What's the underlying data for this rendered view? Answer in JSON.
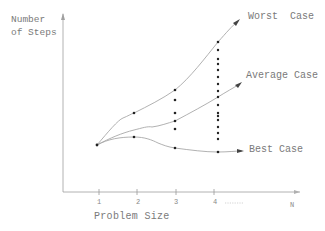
{
  "diagram": {
    "y_axis_label_line1": "Number",
    "y_axis_label_line2": "of Steps",
    "x_axis_label": "Problem Size",
    "x_ticks": [
      "1",
      "2",
      "3",
      "4",
      "N"
    ],
    "x_ellipsis": "......",
    "curves": {
      "worst": {
        "label": "Worst  Case",
        "color": "#9a9a9a"
      },
      "average": {
        "label": "Average Case",
        "color": "#9a9a9a"
      },
      "best": {
        "label": "Best Case",
        "color": "#9a9a9a"
      }
    },
    "dot_color": "#222222",
    "axis_color": "#9a9a9a"
  }
}
